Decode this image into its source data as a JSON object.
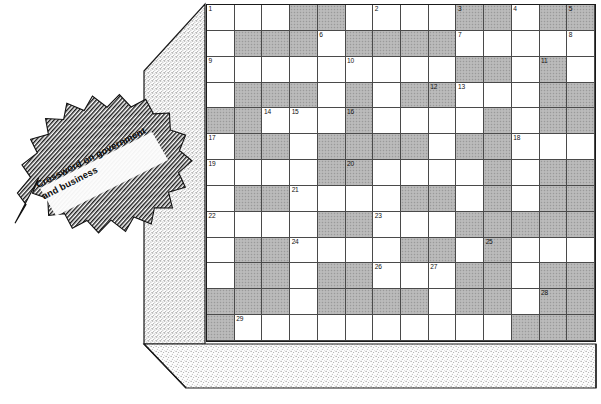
{
  "page": {
    "title_line1": "Crossword on government",
    "title_line2": "and business",
    "banner_icon": "hatched-ribbon-banner",
    "block_icon": "stippled-3d-block"
  },
  "colors": {
    "blocked_cell": "#b5b5b5",
    "open_cell": "#ffffff",
    "grid_line": "#4a4a4a",
    "grid_border": "#1a1a1a",
    "stipple": "#8a8a8a",
    "text": "#0d0d0d"
  },
  "crossword": {
    "columns": 14,
    "rows": 13,
    "legend": {
      "open": 0,
      "blocked": 1
    },
    "blocked_grid": [
      [
        0,
        0,
        0,
        1,
        1,
        0,
        0,
        0,
        0,
        1,
        1,
        0,
        1,
        1
      ],
      [
        0,
        1,
        1,
        1,
        0,
        1,
        1,
        1,
        1,
        0,
        0,
        0,
        0,
        0
      ],
      [
        0,
        0,
        0,
        0,
        0,
        0,
        0,
        0,
        0,
        1,
        1,
        0,
        1,
        0
      ],
      [
        0,
        1,
        1,
        1,
        0,
        1,
        0,
        1,
        1,
        0,
        0,
        0,
        1,
        1
      ],
      [
        1,
        1,
        0,
        0,
        0,
        1,
        0,
        0,
        0,
        0,
        1,
        0,
        1,
        1
      ],
      [
        0,
        1,
        1,
        0,
        1,
        1,
        1,
        1,
        0,
        1,
        1,
        0,
        0,
        0
      ],
      [
        0,
        0,
        0,
        0,
        1,
        1,
        0,
        0,
        0,
        0,
        1,
        0,
        1,
        1
      ],
      [
        0,
        1,
        1,
        0,
        0,
        0,
        0,
        1,
        1,
        0,
        1,
        0,
        1,
        1
      ],
      [
        0,
        0,
        0,
        0,
        1,
        1,
        0,
        0,
        0,
        1,
        1,
        1,
        1,
        1
      ],
      [
        0,
        1,
        1,
        0,
        0,
        0,
        0,
        1,
        1,
        0,
        1,
        0,
        0,
        0
      ],
      [
        0,
        1,
        1,
        0,
        1,
        1,
        0,
        0,
        0,
        1,
        1,
        0,
        1,
        1
      ],
      [
        1,
        1,
        1,
        0,
        1,
        1,
        1,
        1,
        0,
        1,
        1,
        0,
        1,
        1
      ],
      [
        1,
        0,
        0,
        0,
        0,
        0,
        0,
        0,
        0,
        0,
        0,
        1,
        1,
        1
      ]
    ],
    "numbers": [
      {
        "n": "1",
        "row": 0,
        "col": 0
      },
      {
        "n": "2",
        "row": 0,
        "col": 6
      },
      {
        "n": "3",
        "row": 0,
        "col": 9
      },
      {
        "n": "4",
        "row": 0,
        "col": 11
      },
      {
        "n": "5",
        "row": 0,
        "col": 13
      },
      {
        "n": "6",
        "row": 1,
        "col": 4
      },
      {
        "n": "7",
        "row": 1,
        "col": 9
      },
      {
        "n": "8",
        "row": 1,
        "col": 13
      },
      {
        "n": "9",
        "row": 2,
        "col": 0
      },
      {
        "n": "10",
        "row": 2,
        "col": 5
      },
      {
        "n": "11",
        "row": 2,
        "col": 12
      },
      {
        "n": "12",
        "row": 3,
        "col": 8
      },
      {
        "n": "13",
        "row": 3,
        "col": 9
      },
      {
        "n": "14",
        "row": 4,
        "col": 2
      },
      {
        "n": "15",
        "row": 4,
        "col": 3
      },
      {
        "n": "16",
        "row": 4,
        "col": 5
      },
      {
        "n": "17",
        "row": 5,
        "col": 0
      },
      {
        "n": "18",
        "row": 5,
        "col": 11
      },
      {
        "n": "19",
        "row": 6,
        "col": 0
      },
      {
        "n": "20",
        "row": 6,
        "col": 5
      },
      {
        "n": "21",
        "row": 7,
        "col": 3
      },
      {
        "n": "22",
        "row": 8,
        "col": 0
      },
      {
        "n": "23",
        "row": 8,
        "col": 6
      },
      {
        "n": "24",
        "row": 9,
        "col": 3
      },
      {
        "n": "25",
        "row": 9,
        "col": 10
      },
      {
        "n": "26",
        "row": 10,
        "col": 6
      },
      {
        "n": "27",
        "row": 10,
        "col": 8
      },
      {
        "n": "28",
        "row": 11,
        "col": 12
      },
      {
        "n": "29",
        "row": 12,
        "col": 1
      }
    ]
  }
}
